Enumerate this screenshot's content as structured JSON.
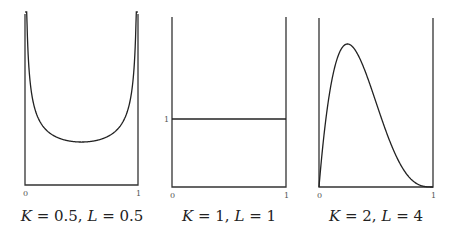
{
  "chart_data": [
    {
      "type": "line",
      "title": "K = 0.5, L = 0.5",
      "distribution": "Beta",
      "params": {
        "K": 0.5,
        "L": 0.5
      },
      "xlabel": "",
      "ylabel": "",
      "x_ticks": [
        "0",
        "1"
      ],
      "y_ticks": [],
      "xlim": [
        0,
        1
      ],
      "ylim": [
        0,
        2.6
      ],
      "grid": false,
      "x": [
        0.005,
        0.01,
        0.02,
        0.05,
        0.1,
        0.2,
        0.3,
        0.4,
        0.5,
        0.6,
        0.7,
        0.8,
        0.9,
        0.95,
        0.98,
        0.99,
        0.995
      ],
      "values": [
        4.5,
        3.2,
        2.27,
        1.46,
        1.06,
        0.8,
        0.69,
        0.65,
        0.64,
        0.65,
        0.69,
        0.8,
        1.06,
        1.46,
        2.27,
        3.2,
        4.5
      ]
    },
    {
      "type": "line",
      "title": "K = 1, L = 1",
      "distribution": "Beta",
      "params": {
        "K": 1,
        "L": 1
      },
      "xlabel": "",
      "ylabel": "",
      "x_ticks": [
        "0",
        "1"
      ],
      "y_ticks": [
        "1"
      ],
      "xlim": [
        0,
        1
      ],
      "ylim": [
        0,
        2.5
      ],
      "grid": false,
      "x": [
        0,
        1
      ],
      "values": [
        1,
        1
      ]
    },
    {
      "type": "line",
      "title": "K = 2, L = 4",
      "distribution": "Beta",
      "params": {
        "K": 2,
        "L": 4
      },
      "xlabel": "",
      "ylabel": "",
      "x_ticks": [
        "0",
        "1"
      ],
      "y_ticks": [],
      "xlim": [
        0,
        1
      ],
      "ylim": [
        0,
        2.5
      ],
      "grid": false,
      "x": [
        0,
        0.05,
        0.1,
        0.15,
        0.2,
        0.25,
        0.3,
        0.35,
        0.4,
        0.45,
        0.5,
        0.55,
        0.6,
        0.65,
        0.7,
        0.75,
        0.8,
        0.85,
        0.9,
        0.95,
        1
      ],
      "values": [
        0,
        1.29,
        1.82,
        2.05,
        2.05,
        2.11,
        2.06,
        1.92,
        1.73,
        1.51,
        1.25,
        1.0,
        0.77,
        0.56,
        0.38,
        0.23,
        0.13,
        0.06,
        0.02,
        0.002,
        0
      ]
    }
  ],
  "panels": [
    {
      "x0": "0",
      "x1": "1",
      "y1": "",
      "caption_k": "K",
      "caption_kv": " = 0.5, ",
      "caption_l": "L",
      "caption_lv": " = 0.5"
    },
    {
      "x0": "0",
      "x1": "1",
      "y1": "1",
      "caption_k": "K",
      "caption_kv": " = 1, ",
      "caption_l": "L",
      "caption_lv": " = 1"
    },
    {
      "x0": "0",
      "x1": "1",
      "y1": "",
      "caption_k": "K",
      "caption_kv": " = 2, ",
      "caption_l": "L",
      "caption_lv": " = 4"
    }
  ],
  "colors": {
    "line": "#222222",
    "axis": "#333333",
    "background": "#ffffff"
  }
}
